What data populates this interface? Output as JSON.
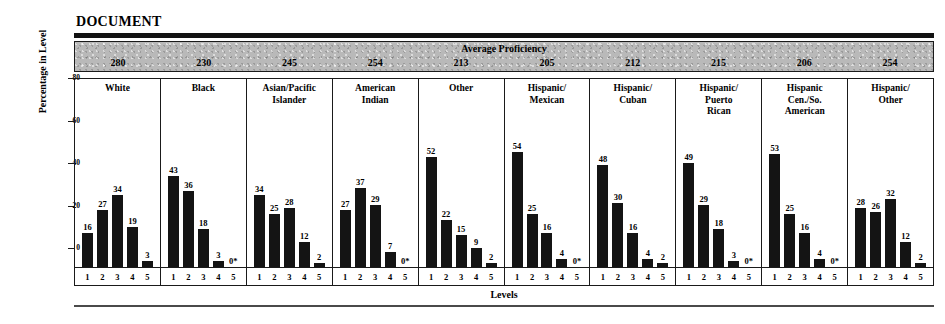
{
  "title": "DOCUMENT",
  "band": {
    "label": "Average Proficiency"
  },
  "axes": {
    "ylabel": "Percentage in Level",
    "xlabel": "Levels",
    "yticks": [
      "0",
      "20",
      "40",
      "60",
      "80"
    ]
  },
  "chart_data": {
    "type": "bar",
    "title": "DOCUMENT",
    "xlabel": "Levels",
    "ylabel": "Percentage in Level",
    "ylim": [
      0,
      80
    ],
    "yticks": [
      0,
      20,
      40,
      60,
      80
    ],
    "grid": false,
    "legend": "none",
    "categories": [
      "1",
      "2",
      "3",
      "4",
      "5"
    ],
    "panel_header_label": "Average Proficiency",
    "panels": [
      {
        "group": "White",
        "average_proficiency": "280",
        "values": [
          16,
          27,
          34,
          19,
          3
        ],
        "labels": [
          "16",
          "27",
          "34",
          "19",
          "3"
        ]
      },
      {
        "group": "Black",
        "average_proficiency": "230",
        "values": [
          43,
          36,
          18,
          3,
          0
        ],
        "labels": [
          "43",
          "36",
          "18",
          "3",
          "0*"
        ]
      },
      {
        "group": "Asian/Pacific Islander",
        "average_proficiency": "245",
        "values": [
          34,
          25,
          28,
          12,
          2
        ],
        "labels": [
          "34",
          "25",
          "28",
          "12",
          "2"
        ]
      },
      {
        "group": "American Indian",
        "average_proficiency": "254",
        "values": [
          27,
          37,
          29,
          7,
          0
        ],
        "labels": [
          "27",
          "37",
          "29",
          "7",
          "0*"
        ]
      },
      {
        "group": "Other",
        "average_proficiency": "213",
        "values": [
          52,
          22,
          15,
          9,
          2
        ],
        "labels": [
          "52",
          "22",
          "15",
          "9",
          "2"
        ]
      },
      {
        "group": "Hispanic/ Mexican",
        "average_proficiency": "205",
        "values": [
          54,
          25,
          16,
          4,
          0
        ],
        "labels": [
          "54",
          "25",
          "16",
          "4",
          "0*"
        ]
      },
      {
        "group": "Hispanic/ Cuban",
        "average_proficiency": "212",
        "values": [
          48,
          30,
          16,
          4,
          2
        ],
        "labels": [
          "48",
          "30",
          "16",
          "4",
          "2"
        ]
      },
      {
        "group": "Hispanic/ Puerto Rican",
        "average_proficiency": "215",
        "values": [
          49,
          29,
          18,
          3,
          0
        ],
        "labels": [
          "49",
          "29",
          "18",
          "3",
          "0*"
        ]
      },
      {
        "group": "Hispanic Cen./So. American",
        "average_proficiency": "206",
        "values": [
          53,
          25,
          16,
          4,
          0
        ],
        "labels": [
          "53",
          "25",
          "16",
          "4",
          "0*"
        ]
      },
      {
        "group": "Hispanic/ Other",
        "average_proficiency": "254",
        "values": [
          28,
          26,
          32,
          12,
          2
        ],
        "labels": [
          "28",
          "26",
          "32",
          "12",
          "2"
        ]
      }
    ]
  }
}
